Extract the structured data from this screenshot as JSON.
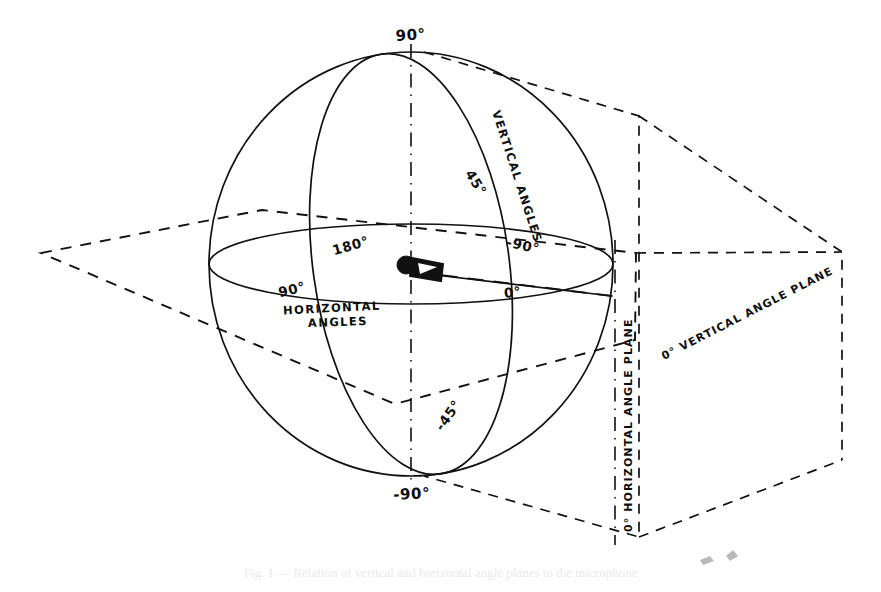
{
  "figure": {
    "kind": "technical-line-drawing",
    "background_color": "#ffffff",
    "ink_color": "#111111",
    "caption": "Fig. 1 — Relation of vertical and horizontal angle planes to the microphone",
    "caption_visible": "mostly clipped at the bottom edge of the image"
  },
  "labels": {
    "top_pole": "90°",
    "bottom_pole": "-90°",
    "vertical_angles": "VERTICAL ANGLES",
    "vertical_45": "45°",
    "vertical_minus_45": "-45°",
    "horizontal_angles_line1": "HORIZONTAL",
    "horizontal_angles_line2": "ANGLES",
    "horizontal_180": "180°",
    "horizontal_90": "90°",
    "horizontal_minus_90": "-90°",
    "horizontal_0": "0°",
    "vertical_angle_plane": "0° VERTICAL ANGLE PLANE",
    "horizontal_angle_plane": "0° HORIZONTAL ANGLE PLANE"
  },
  "elements": {
    "sphere": "great-circle sphere outline",
    "equator": "horizontal angle great circle (ellipse)",
    "meridian": "vertical angle great circle (ellipse)",
    "polar_axis": "dash-dot vertical axis through poles",
    "microphone": "microphone icon at sphere center",
    "horizontal_plane": "dashed parallelogram through the equator",
    "vertical_plane": "dashed rectangle standing on the 0° meridian",
    "reference_ray": "long-dashed ray from center to 0° direction"
  }
}
